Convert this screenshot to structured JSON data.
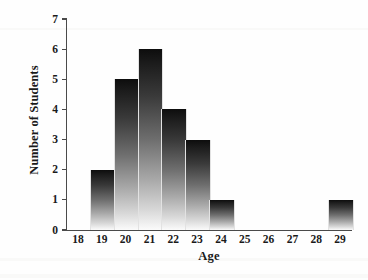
{
  "chart_data": {
    "type": "bar",
    "title": "",
    "xlabel": "Age",
    "ylabel": "Number of Students",
    "categories": [
      "18",
      "19",
      "20",
      "21",
      "22",
      "23",
      "24",
      "25",
      "26",
      "27",
      "28",
      "29"
    ],
    "values": [
      0,
      2,
      5,
      6,
      4,
      3,
      1,
      0,
      0,
      0,
      0,
      1
    ],
    "ylim": [
      0,
      7
    ],
    "yticks": [
      "0",
      "1",
      "2",
      "3",
      "4",
      "5",
      "6",
      "7"
    ],
    "ytick_values": [
      0,
      1,
      2,
      3,
      4,
      5,
      6,
      7
    ],
    "grid": false,
    "legend": false,
    "bar_fill": "vertical-gradient-dark-to-light",
    "bar_color_top": "#0d0d0d",
    "bar_color_bottom": "#fbfbfb",
    "axis_color": "#4a4a4a",
    "background": "#ffffff"
  }
}
